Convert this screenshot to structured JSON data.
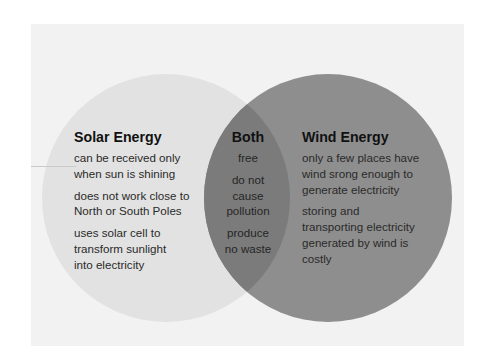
{
  "diagram": {
    "type": "venn",
    "colors": {
      "page_background": "#ffffff",
      "panel_background": "#f2f2f2",
      "left_circle": "#e2e2e2",
      "right_circle": "#8e8e8e",
      "overlap": "#7b7b7b"
    },
    "left": {
      "title": "Solar Energy",
      "items": [
        "can be received only when sun is shining",
        "does not work close to North or South Poles",
        "uses solar cell to transform sunlight into electricity"
      ],
      "lines": [
        [
          "can be received only",
          "when sun is shining"
        ],
        [
          "does not work close to",
          "North or South Poles"
        ],
        [
          "uses solar cell to",
          "transform sunlight",
          "into electricity"
        ]
      ]
    },
    "both": {
      "title": "Both",
      "items": [
        "free",
        "do not cause pollution",
        "produce no waste"
      ],
      "lines": [
        [
          "free"
        ],
        [
          "do not",
          "cause",
          "pollution"
        ],
        [
          "produce",
          "no waste"
        ]
      ]
    },
    "right": {
      "title": "Wind Energy",
      "items": [
        "only a few places have wind srong enough to generate electricity",
        "storing and transporting electricity generated by wind is costly"
      ],
      "lines": [
        [
          "only a few places have",
          "wind srong enough to",
          "generate electricity"
        ],
        [
          "storing and",
          "transporting electricity",
          "generated by wind is",
          "costly"
        ]
      ]
    }
  }
}
